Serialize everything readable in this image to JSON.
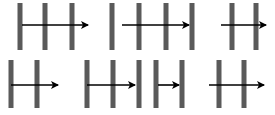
{
  "diagram": {
    "colors": {
      "barrier": "#5a5a5a",
      "arrow": "#000000",
      "background": "#ffffff"
    },
    "panels": [
      {
        "id": "panel-1",
        "row": 1,
        "barriers": 3,
        "arrow": "starts at barrier 1, crosses barriers 2 and 3, ends past barrier 3"
      },
      {
        "id": "panel-2",
        "row": 1,
        "barriers": 4,
        "arrow": "starts between barriers 1 and 2, crosses barriers 2 and 3, ends at barrier 4"
      },
      {
        "id": "panel-3",
        "row": 1,
        "barriers": 2,
        "arrow": "starts before barrier 1, crosses barrier 1, ends at barrier 2"
      },
      {
        "id": "panel-4",
        "row": 2,
        "barriers": 2,
        "arrow": "starts at barrier 1, crosses barrier 2, ends past barrier 2"
      },
      {
        "id": "panel-5",
        "row": 2,
        "barriers": 5,
        "arrows": [
          "starts at barrier 1, crosses barrier 2, ends at barrier 3",
          "starts after barrier 4, ends at barrier 5"
        ]
      },
      {
        "id": "panel-6",
        "row": 2,
        "barriers": 2,
        "arrow": "starts before barrier 1, crosses barriers 1 and 2, ends past barrier 2"
      }
    ]
  }
}
